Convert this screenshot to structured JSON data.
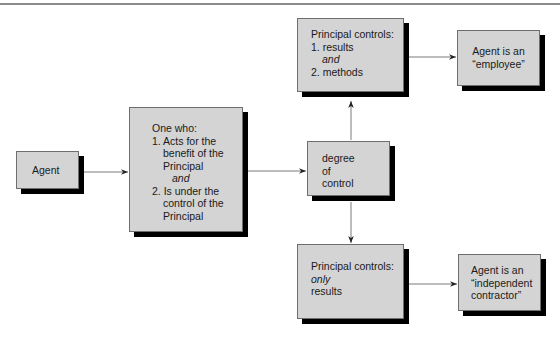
{
  "diagram": {
    "nodes": {
      "agent": {
        "label": "Agent"
      },
      "definition": {
        "lines": [
          "One who:",
          "1. Acts for the",
          "benefit of the",
          "Principal",
          "and",
          "2. Is under the",
          "control of the",
          "Principal"
        ]
      },
      "degree": {
        "lines": [
          "degree",
          "of",
          "control"
        ]
      },
      "controls_both": {
        "lines": [
          "Principal controls:",
          "1. results",
          "and",
          "2. methods"
        ]
      },
      "employee": {
        "lines": [
          "Agent is an",
          "“employee”"
        ]
      },
      "controls_results": {
        "lines": [
          "Principal controls:",
          "only",
          "results"
        ]
      },
      "contractor": {
        "lines": [
          "Agent is an",
          "“independent",
          "contractor”"
        ]
      }
    },
    "edges": [
      {
        "from": "Agent",
        "to": "One who"
      },
      {
        "from": "One who",
        "to": "degree of control"
      },
      {
        "from": "degree of control",
        "to": "Principal controls: results and methods"
      },
      {
        "from": "degree of control",
        "to": "Principal controls: only results"
      },
      {
        "from": "Principal controls: results and methods",
        "to": "Agent is an employee"
      },
      {
        "from": "Principal controls: only results",
        "to": "Agent is an independent contractor"
      }
    ],
    "colors": {
      "box_fill": "#d4d4d4",
      "box_border": "#6e6e6e",
      "shadow": "#000000",
      "connector": "#7a7a7a",
      "arrowhead": "#222222"
    }
  }
}
